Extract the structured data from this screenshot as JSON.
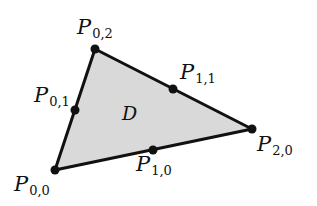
{
  "diagram": {
    "type": "triangular-region-with-control-points",
    "region": {
      "label": "D",
      "fill": "#d9d9d9",
      "stroke": "#111111"
    },
    "vertices": [
      {
        "id": "P00",
        "x": 55,
        "y": 170
      },
      {
        "id": "P20",
        "x": 252,
        "y": 129
      },
      {
        "id": "P02",
        "x": 95,
        "y": 49
      }
    ],
    "points": [
      {
        "id": "P00",
        "letter": "P",
        "sub": "0,0",
        "x": 55,
        "y": 170,
        "lx": 14,
        "ly": 174
      },
      {
        "id": "P10",
        "letter": "P",
        "sub": "1,0",
        "x": 153,
        "y": 150,
        "lx": 136,
        "ly": 154
      },
      {
        "id": "P20",
        "letter": "P",
        "sub": "2,0",
        "x": 252,
        "y": 129,
        "lx": 257,
        "ly": 134
      },
      {
        "id": "P01",
        "letter": "P",
        "sub": "0,1",
        "x": 75,
        "y": 110,
        "lx": 34,
        "ly": 85
      },
      {
        "id": "P11",
        "letter": "P",
        "sub": "1,1",
        "x": 173,
        "y": 89,
        "lx": 180,
        "ly": 62
      },
      {
        "id": "P02",
        "letter": "P",
        "sub": "0,2",
        "x": 95,
        "y": 49,
        "lx": 77,
        "ly": 17
      }
    ],
    "region_label_pos": {
      "x": 122,
      "y": 104
    }
  }
}
